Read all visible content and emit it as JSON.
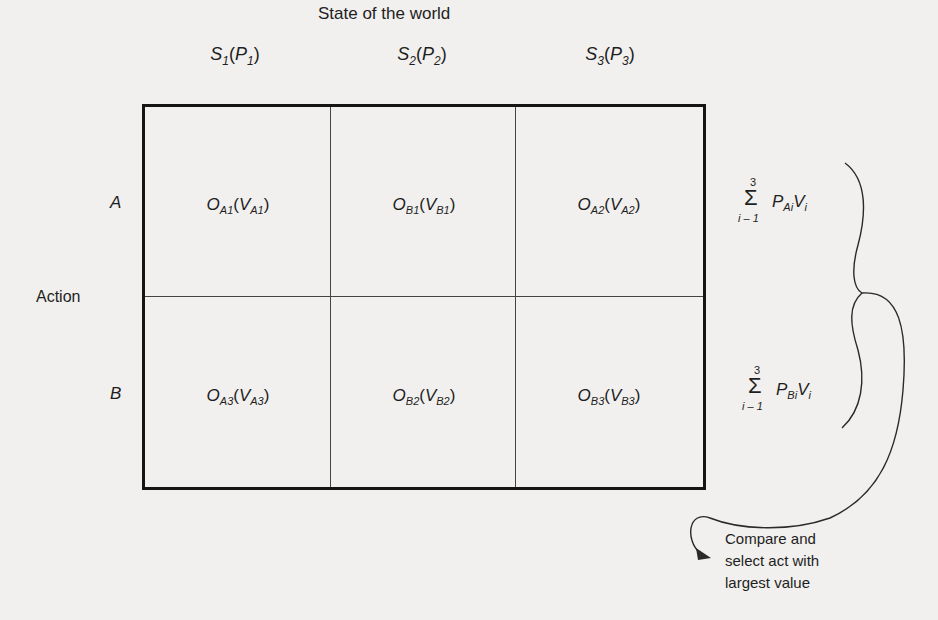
{
  "diagram": {
    "title": "State of the world",
    "columns": [
      {
        "state": "S",
        "state_index": "1",
        "prob": "P",
        "prob_index": "1"
      },
      {
        "state": "S",
        "state_index": "2",
        "prob": "P",
        "prob_index": "2"
      },
      {
        "state": "S",
        "state_index": "3",
        "prob": "P",
        "prob_index": "3"
      }
    ],
    "row_axis_label": "Action",
    "rows": [
      {
        "label": "A",
        "cells": [
          {
            "o": "O",
            "o_sub": "A1",
            "v": "V",
            "v_sub": "A1"
          },
          {
            "o": "O",
            "o_sub": "B1",
            "v": "V",
            "v_sub": "B1"
          },
          {
            "o": "O",
            "o_sub": "A2",
            "v": "V",
            "v_sub": "A2"
          }
        ],
        "sum": {
          "upper": "3",
          "lower": "i – 1",
          "p": "P",
          "p_sub": "Ai",
          "v": "V",
          "v_sub": "i"
        }
      },
      {
        "label": "B",
        "cells": [
          {
            "o": "O",
            "o_sub": "A3",
            "v": "V",
            "v_sub": "A3"
          },
          {
            "o": "O",
            "o_sub": "B2",
            "v": "V",
            "v_sub": "B2"
          },
          {
            "o": "O",
            "o_sub": "B3",
            "v": "V",
            "v_sub": "B3"
          }
        ],
        "sum": {
          "upper": "3",
          "lower": "i – 1",
          "p": "P",
          "p_sub": "Bi",
          "v": "V",
          "v_sub": "i"
        }
      }
    ],
    "sigma_symbol": "Σ",
    "open_paren": "(",
    "close_paren": ")",
    "conclusion": {
      "line1": "Compare and",
      "line2": "select act with",
      "line3": "largest value"
    },
    "colors": {
      "background": "#f1f0ee",
      "ink": "#1e1e1e"
    }
  }
}
